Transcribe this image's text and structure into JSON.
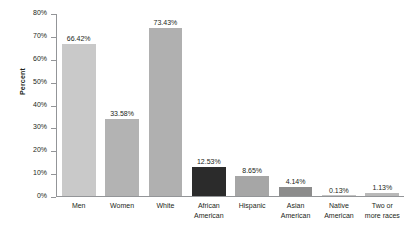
{
  "chart_data": {
    "type": "bar",
    "title": "",
    "xlabel": "",
    "ylabel": "Percent",
    "ylim": [
      0,
      80
    ],
    "grid": false,
    "legend": "none",
    "y_tick_labels": [
      "80%",
      "70%",
      "60%",
      "50%",
      "40%",
      "30%",
      "20%",
      "10%",
      "0%"
    ],
    "y_ticks": [
      80,
      70,
      60,
      50,
      40,
      30,
      20,
      10,
      0
    ],
    "categories": [
      "Men",
      "Women",
      "White",
      "African American",
      "Hispanic",
      "Asian American",
      "Native American",
      "Two or more races"
    ],
    "category_lines": [
      [
        "Men"
      ],
      [
        "Women"
      ],
      [
        "White"
      ],
      [
        "African",
        "American"
      ],
      [
        "Hispanic"
      ],
      [
        "Asian",
        "American"
      ],
      [
        "Native",
        "American"
      ],
      [
        "Two or",
        "more races"
      ]
    ],
    "values": [
      66.42,
      33.58,
      73.43,
      12.53,
      8.65,
      4.14,
      0.13,
      1.13
    ],
    "value_labels": [
      "66.42%",
      "33.58%",
      "73.43%",
      "12.53%",
      "8.65%",
      "4.14%",
      "0.13%",
      "1.13%"
    ],
    "bar_colors": [
      "#c9c9c9",
      "#b3b3b3",
      "#b0b0b0",
      "#2b2b2b",
      "#a6a6a6",
      "#8c8c8c",
      "#c4c4c4",
      "#b9b9b9"
    ]
  },
  "colors": {
    "background": "#ffffff",
    "axis": "#939598",
    "text": "#231f20"
  }
}
